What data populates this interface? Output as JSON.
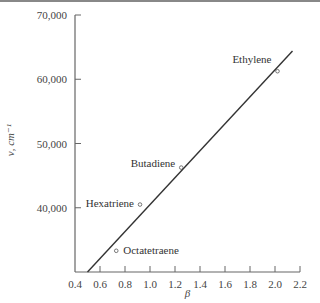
{
  "chart_data": {
    "type": "scatter",
    "title": "",
    "xlabel": "β",
    "ylabel": "ν, cm⁻¹",
    "xlim": [
      0.4,
      2.2
    ],
    "ylim": [
      30000,
      70000
    ],
    "x_ticks": [
      "0.4",
      "0.6",
      "0.8",
      "1.0",
      "1.2",
      "1.4",
      "1.6",
      "1.8",
      "2.0",
      "2.2"
    ],
    "y_ticks": [
      "40,000",
      "50,000",
      "60,000",
      "70,000"
    ],
    "grid": false,
    "legend": "none",
    "series": [
      {
        "name": "Polyenes",
        "marker": "open-circle",
        "points": [
          {
            "label": "Ethylene",
            "x": 2.02,
            "y": 61250
          },
          {
            "label": "Butadiene",
            "x": 1.25,
            "y": 46250
          },
          {
            "label": "Hexatriene",
            "x": 0.92,
            "y": 40500
          },
          {
            "label": "Octatetraene",
            "x": 0.73,
            "y": 33300
          }
        ]
      },
      {
        "name": "Linear fit",
        "type": "line",
        "points": [
          {
            "x": 0.5,
            "y": 30000
          },
          {
            "x": 2.14,
            "y": 64400
          }
        ]
      }
    ]
  }
}
